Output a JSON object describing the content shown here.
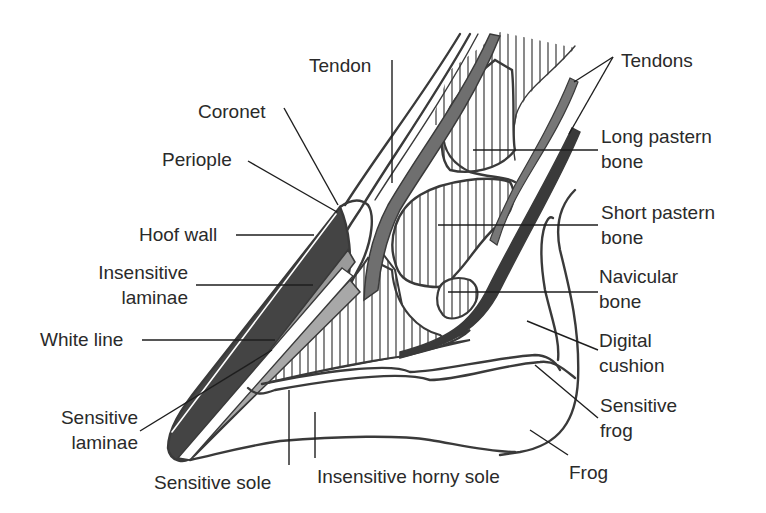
{
  "diagram": {
    "colors": {
      "background": "#ffffff",
      "outline": "#3a3a3a",
      "hoof_wall_fill": "#444444",
      "laminae_fill": "#9a9a9a",
      "tendon_fill": "#6f6f6f",
      "text": "#2a2a2a"
    },
    "labels": {
      "tendon": "Tendon",
      "tendons": "Tendons",
      "coronet": "Coronet",
      "periople": "Periople",
      "hoof_wall": "Hoof wall",
      "insensitive_laminae_1": "Insensitive",
      "insensitive_laminae_2": "laminae",
      "white_line": "White line",
      "sensitive_laminae_1": "Sensitive",
      "sensitive_laminae_2": "laminae",
      "sensitive_sole": "Sensitive sole",
      "insensitive_horny_sole": "Insensitive horny sole",
      "frog": "Frog",
      "long_pastern_bone_1": "Long pastern",
      "long_pastern_bone_2": "bone",
      "short_pastern_bone_1": "Short pastern",
      "short_pastern_bone_2": "bone",
      "navicular_bone_1": "Navicular",
      "navicular_bone_2": "bone",
      "digital_cushion_1": "Digital",
      "digital_cushion_2": "cushion",
      "sensitive_frog_1": "Sensitive",
      "sensitive_frog_2": "frog"
    }
  }
}
